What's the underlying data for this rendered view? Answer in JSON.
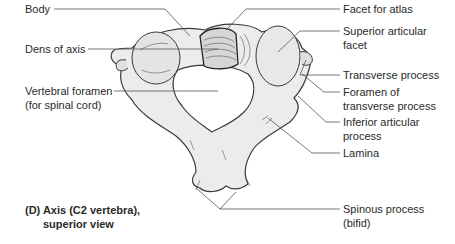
{
  "figure": {
    "caption_line1": "(D) Axis (C2 vertebra),",
    "caption_line2": "superior view"
  },
  "labels_left": {
    "body": "Body",
    "dens": "Dens of axis",
    "foramen_line1": "Vertebral foramen",
    "foramen_line2": "(for spinal cord)"
  },
  "labels_right": {
    "facet_atlas": "Facet for atlas",
    "sup_facet_line1": "Superior articular",
    "sup_facet_line2": "facet",
    "transverse": "Transverse process",
    "foramen_trans_line1": "Foramen of",
    "foramen_trans_line2": "transverse process",
    "inf_articular_line1": "Inferior articular",
    "inf_articular_line2": "process",
    "lamina": "Lamina",
    "spinous_line1": "Spinous process",
    "spinous_line2": "(bifid)"
  },
  "colors": {
    "bone_fill": "#ececec",
    "bone_stroke": "#3a3a3a",
    "leader_line": "#555555",
    "text": "#2a2a2a"
  }
}
